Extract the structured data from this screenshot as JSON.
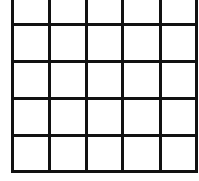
{
  "diagram": {
    "type": "grid",
    "rows": 5,
    "columns": 5,
    "line_color": "#111111",
    "background": "#ffffff",
    "vertical_lines_x": [
      12,
      49,
      86,
      122,
      160,
      196
    ],
    "horizontal_lines_y": [
      24,
      61,
      98,
      135,
      171
    ],
    "top_open": true,
    "grid_top": 0,
    "grid_bottom": 173,
    "grid_left": 12,
    "grid_right": 199
  }
}
